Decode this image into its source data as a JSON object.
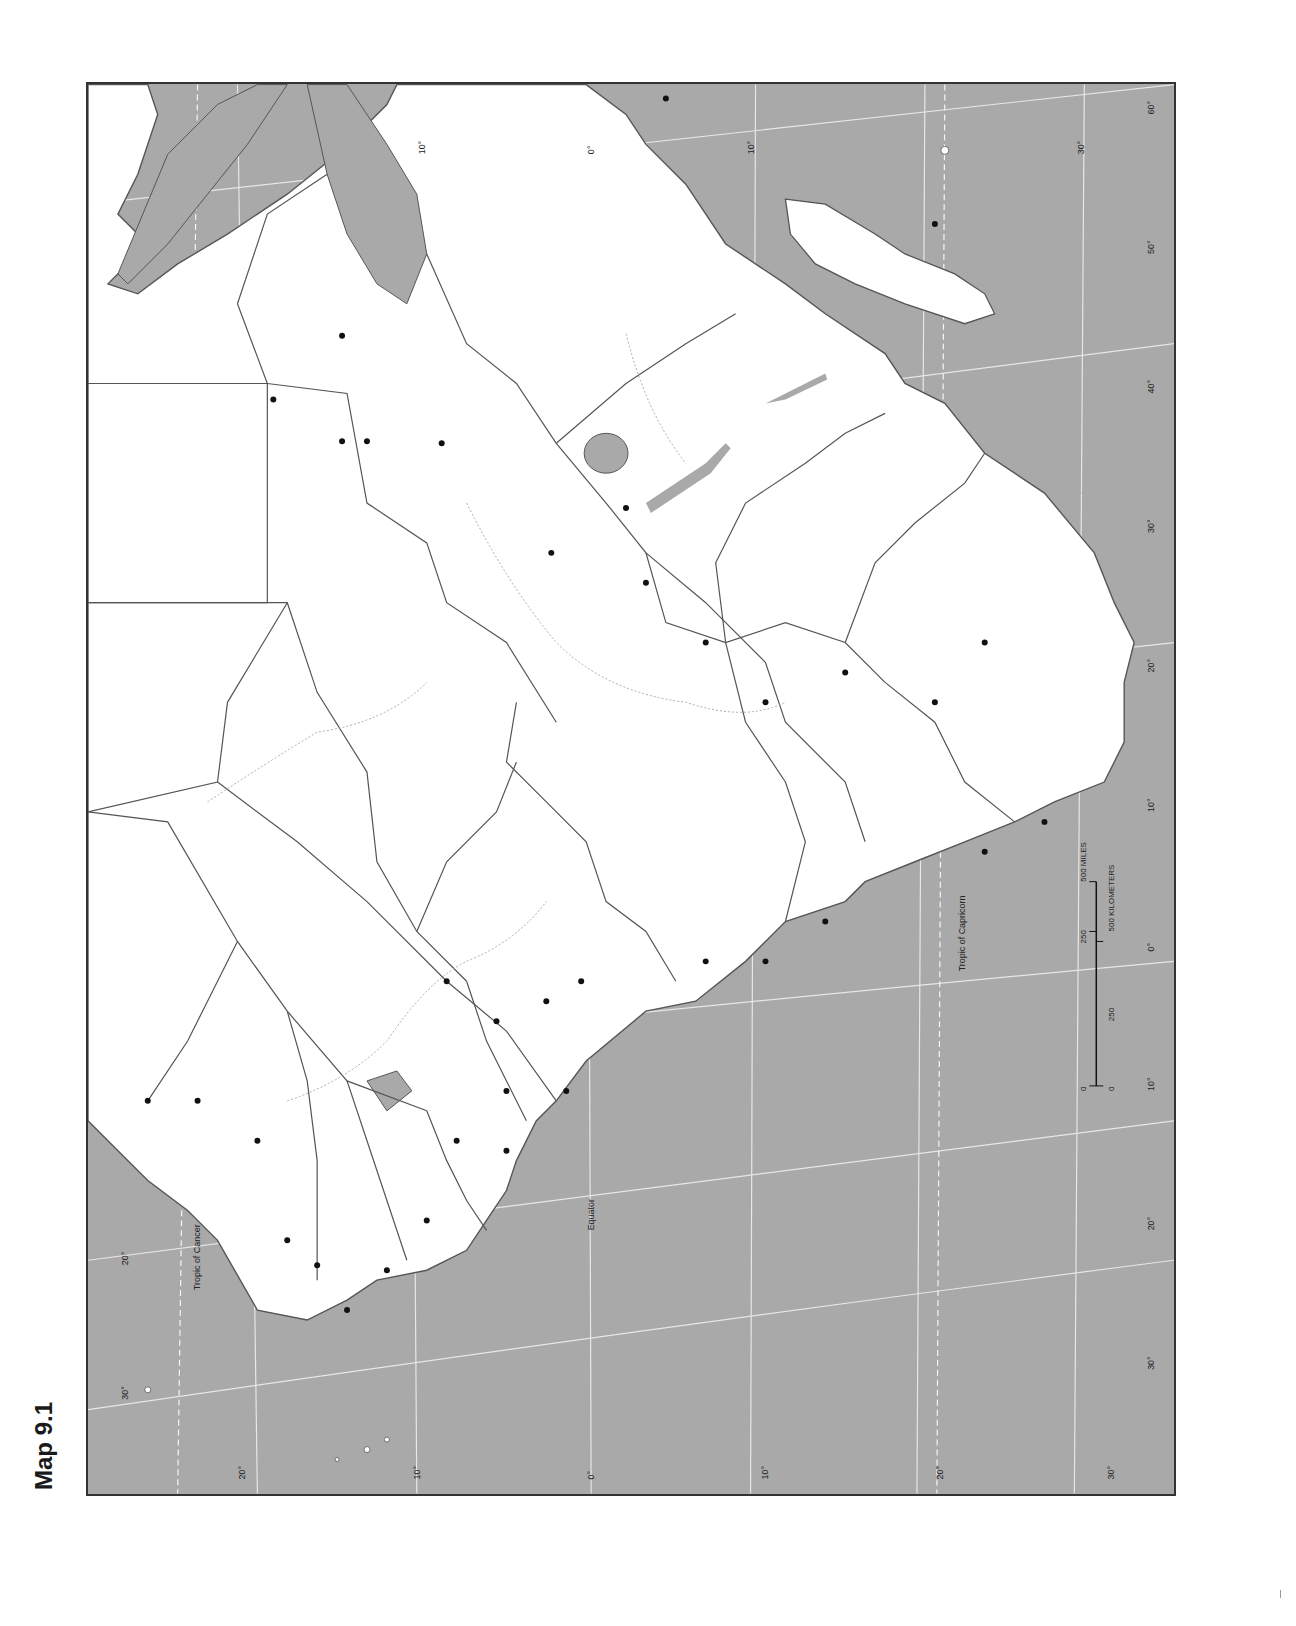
{
  "title": "Map 9.1",
  "map": {
    "subject": "Africa outline map (political boundaries, blank)",
    "orientation": "rotated 90 degrees counter-clockwise",
    "colors": {
      "ocean": "#a9a9a9",
      "land": "#ffffff",
      "border": "#555555",
      "graticule": "#eeeeee",
      "river": "#aaaaaa",
      "city": "#111111",
      "frame": "#333333"
    },
    "labels": {
      "tropic_of_cancer": "Tropic of Cancer",
      "equator": "Equator",
      "tropic_of_capricorn": "Tropic of Capricorn"
    },
    "latitude_ticks_top": [
      "10°",
      "0°",
      "10°",
      "30°"
    ],
    "longitude_ticks_right": [
      "60°",
      "50°",
      "40°",
      "30°",
      "20°",
      "10°",
      "0°",
      "10°",
      "20°",
      "30°"
    ],
    "latitude_ticks_left": [
      "30°",
      "20°",
      "10°",
      "0°",
      "10°",
      "20°",
      "30°"
    ],
    "left_edge_ticks": [
      "20°",
      "30°"
    ],
    "scale_bar": {
      "miles_labels": [
        "0",
        "250",
        "500 MILES"
      ],
      "km_labels": [
        "0",
        "250",
        "500 KILOMETERS"
      ]
    }
  }
}
